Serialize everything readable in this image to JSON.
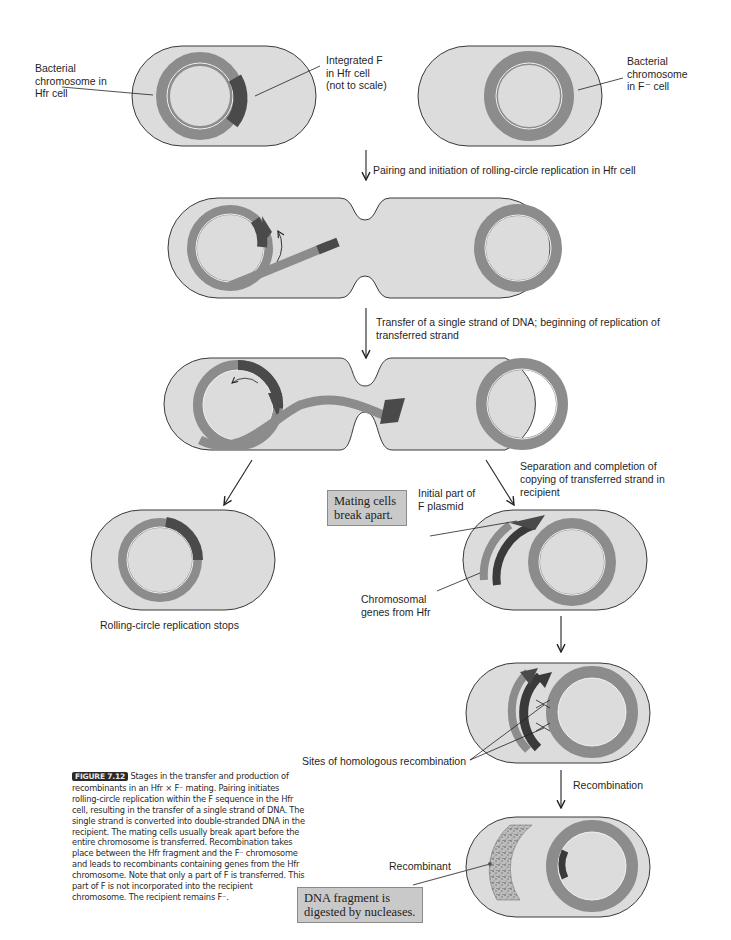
{
  "colors": {
    "cell_fill": "#dcdcdc",
    "cell_stroke": "#3a3a3a",
    "chromosome": "#8c8c8c",
    "f_factor": "#4a4a4a",
    "f_factor_dark": "#3a3a3a",
    "inner_line": "#f0f0f0",
    "box_fill": "#c9c9c9",
    "caption_tag_bg": "#2b2b2b"
  },
  "labels": {
    "hfr_chromosome": [
      "Bacterial",
      "chromosome in",
      "Hfr cell"
    ],
    "integrated_f": [
      "Integrated F",
      "in Hfr cell",
      "(not to scale)"
    ],
    "fminus_chromosome": [
      "Bacterial",
      "chromosome",
      "in F⁻ cell"
    ],
    "initial_part_f": [
      "Initial part of",
      "F plasmid"
    ],
    "chromosomal_genes": [
      "Chromosomal",
      "genes from Hfr"
    ],
    "sites_recombination": "Sites of homologous recombination",
    "recombinant": "Recombinant",
    "rolling_stops": "Rolling-circle replication stops"
  },
  "steps": {
    "pairing": "Pairing and initiation of rolling-circle replication in Hfr cell",
    "transfer": [
      "Transfer of a single strand of DNA; beginning of replication of",
      "transferred strand"
    ],
    "separation": [
      "Separation and completion of",
      "copying of transferred strand in",
      "recipient"
    ],
    "recombination": "Recombination"
  },
  "boxes": {
    "mating": [
      "Mating cells",
      "break apart."
    ],
    "digested": [
      "DNA fragment is",
      "digested by nucleases."
    ]
  },
  "caption": {
    "tag": "FIGURE 7.12",
    "text": "Stages in the transfer and production of recombinants in an Hfr × F⁻ mating. Pairing initiates rolling-circle replication within the F sequence in the Hfr cell, resulting in the transfer of a single strand of DNA. The single strand is converted into double-stranded DNA in the recipient. The mating cells usually break apart before the entire chromosome is transferred. Recombination takes place between the Hfr fragment and the F⁻ chromosome and leads to recombinants containing genes from the Hfr chromosome. Note that only a part of F is transferred. This part of F is not incorporated into the recipient chromosome. The recipient remains F⁻."
  }
}
